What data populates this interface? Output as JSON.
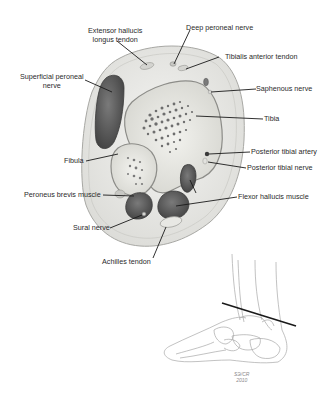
{
  "diagram": {
    "type": "anatomical cross-section",
    "labels": {
      "extensor_hallucis_line1": "Extensor hallucis",
      "extensor_hallucis_line2": "longus tendon",
      "deep_peroneal": "Deep peroneal nerve",
      "tibialis_anterior": "Tibialis anterior tendon",
      "superficial_peroneal_line1": "Superficial peroneal",
      "superficial_peroneal_line2": "nerve",
      "saphenous": "Saphenous nerve",
      "tibia": "Tibia",
      "posterior_tibial_artery": "Posterior tibial artery",
      "posterior_tibial_nerve": "Posterior tibial nerve",
      "fibula": "Fibula",
      "peroneus_brevis": "Peroneus brevis muscle",
      "flexor_hallucis": "Flexor hallucis muscle",
      "sural_nerve": "Sural nerve",
      "achilles": "Achilles tendon"
    },
    "signature_line1": "SЭ/CR",
    "signature_line2": "2010",
    "colors": {
      "muscle": "#5a5a5a",
      "bone": "#e6e6e0",
      "tissue": "#ececea",
      "outline": "#9a9a9a",
      "leader": "#1a1a1a"
    }
  }
}
